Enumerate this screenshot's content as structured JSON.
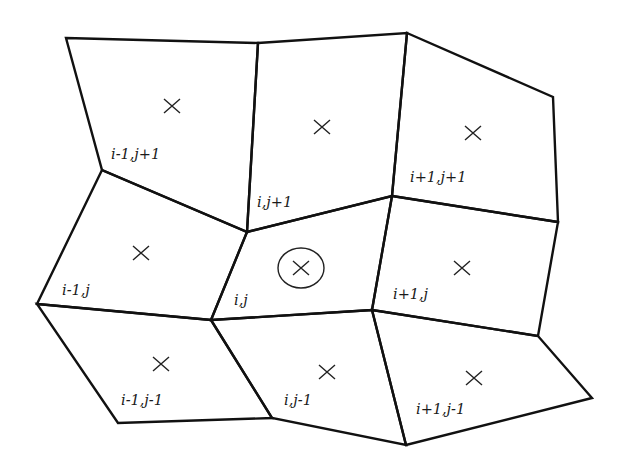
{
  "diagram": {
    "title": "",
    "type": "quadrilateral mesh stencil",
    "colors": {
      "lines": "#111111",
      "background": "#ffffff"
    },
    "vertices": {
      "A0": [
        66,
        38
      ],
      "A1": [
        258,
        43
      ],
      "A2": [
        407,
        33
      ],
      "A3": [
        553,
        97
      ],
      "B0": [
        102,
        170
      ],
      "B1": [
        247,
        232
      ],
      "B2": [
        392,
        196
      ],
      "B3": [
        558,
        222
      ],
      "C0": [
        37,
        304
      ],
      "C1": [
        211,
        320
      ],
      "C2": [
        372,
        310
      ],
      "C3": [
        538,
        336
      ],
      "D0": [
        118,
        423
      ],
      "D1": [
        272,
        418
      ],
      "D2": [
        406,
        445
      ],
      "D3": [
        592,
        398
      ]
    },
    "cells": [
      {
        "id": "i-1,j+1",
        "label": "i-1,j+1",
        "corners": [
          "A0",
          "A1",
          "B1",
          "B0"
        ],
        "center": [
          172,
          106
        ],
        "label_pos": [
          111,
          159
        ],
        "highlighted": false
      },
      {
        "id": "i,j+1",
        "label": "i,j+1",
        "corners": [
          "A1",
          "A2",
          "B2",
          "B1"
        ],
        "center": [
          322,
          127
        ],
        "label_pos": [
          257,
          207
        ],
        "highlighted": false
      },
      {
        "id": "i+1,j+1",
        "label": "i+1,j+1",
        "corners": [
          "A2",
          "A3",
          "B3",
          "B2"
        ],
        "center": [
          473,
          133
        ],
        "label_pos": [
          410,
          182
        ],
        "highlighted": false
      },
      {
        "id": "i-1,j",
        "label": "i-1,j",
        "corners": [
          "B0",
          "B1",
          "C1",
          "C0"
        ],
        "center": [
          141,
          253
        ],
        "label_pos": [
          62,
          295
        ],
        "highlighted": false
      },
      {
        "id": "i,j",
        "label": "i,j",
        "corners": [
          "B1",
          "B2",
          "C2",
          "C1"
        ],
        "center": [
          301,
          268
        ],
        "label_pos": [
          234,
          305
        ],
        "highlighted": true
      },
      {
        "id": "i+1,j",
        "label": "i+1,j",
        "corners": [
          "B2",
          "B3",
          "C3",
          "C2"
        ],
        "center": [
          462,
          268
        ],
        "label_pos": [
          393,
          299
        ],
        "highlighted": false
      },
      {
        "id": "i-1,j-1",
        "label": "i-1,j-1",
        "corners": [
          "C0",
          "C1",
          "D1",
          "D0"
        ],
        "center": [
          161,
          364
        ],
        "label_pos": [
          121,
          405
        ],
        "highlighted": false
      },
      {
        "id": "i,j-1",
        "label": "i,j-1",
        "corners": [
          "C1",
          "C2",
          "D2",
          "D1"
        ],
        "center": [
          327,
          372
        ],
        "label_pos": [
          284,
          405
        ],
        "highlighted": false
      },
      {
        "id": "i+1,j-1",
        "label": "i+1,j-1",
        "corners": [
          "C2",
          "C3",
          "D3",
          "D2"
        ],
        "center": [
          474,
          378
        ],
        "label_pos": [
          416,
          414
        ],
        "highlighted": false
      }
    ],
    "highlight_ring": {
      "cx": 301,
      "cy": 268,
      "rx": 23,
      "ry": 20
    }
  }
}
